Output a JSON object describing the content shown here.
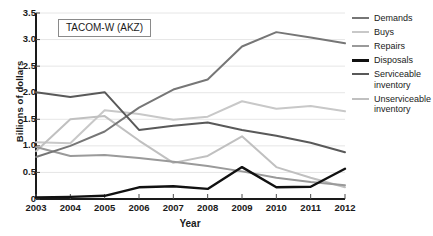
{
  "chart_data": {
    "type": "line",
    "title": "TACOM-W (AKZ)",
    "xlabel": "Year",
    "ylabel": "Billions of dollars",
    "x": [
      2003,
      2004,
      2005,
      2006,
      2007,
      2008,
      2009,
      2010,
      2011,
      2012
    ],
    "xticklabels": [
      "2003",
      "2004",
      "2005",
      "2006",
      "2007",
      "2008",
      "2009",
      "2010",
      "2011",
      "2012"
    ],
    "yticklabels": [
      "0",
      "0.5",
      "1.0",
      "1.5",
      "2.0",
      "2.5",
      "3.0",
      "3.5"
    ],
    "ytickvalues": [
      0,
      0.5,
      1.0,
      1.5,
      2.0,
      2.5,
      3.0,
      3.5
    ],
    "ylim": [
      0,
      3.5
    ],
    "xlim": [
      2003,
      2012
    ],
    "grid": true,
    "legend_position": "right",
    "series": [
      {
        "name": "Demands",
        "color": "#767676",
        "width": 2.0,
        "values": [
          0.79,
          1.0,
          1.27,
          1.72,
          2.06,
          2.25,
          2.87,
          3.14,
          3.04,
          2.93
        ]
      },
      {
        "name": "Buys",
        "color": "#c8c8c8",
        "width": 2.0,
        "values": [
          1.07,
          1.05,
          1.67,
          1.6,
          1.49,
          1.55,
          1.84,
          1.7,
          1.75,
          1.65
        ]
      },
      {
        "name": "Repairs",
        "color": "#9a9a9a",
        "width": 2.0,
        "values": [
          0.98,
          0.81,
          0.83,
          0.77,
          0.7,
          0.62,
          0.52,
          0.4,
          0.32,
          0.26
        ]
      },
      {
        "name": "Disposals",
        "color": "#111111",
        "width": 2.4,
        "values": [
          0.03,
          0.04,
          0.06,
          0.22,
          0.24,
          0.19,
          0.6,
          0.22,
          0.23,
          0.57
        ]
      },
      {
        "name": "Serviceable inventory",
        "color": "#595959",
        "width": 2.0,
        "values": [
          2.01,
          1.92,
          2.01,
          1.3,
          1.38,
          1.44,
          1.3,
          1.19,
          1.06,
          0.88
        ]
      },
      {
        "name": "Unserviceable inventory",
        "color": "#c0c0c0",
        "width": 2.0,
        "values": [
          0.9,
          1.5,
          1.56,
          1.1,
          0.68,
          0.81,
          1.18,
          0.6,
          0.4,
          0.22
        ]
      }
    ]
  },
  "legend": {
    "items": [
      {
        "label": "Demands"
      },
      {
        "label": "Buys"
      },
      {
        "label": "Repairs"
      },
      {
        "label": "Disposals"
      },
      {
        "label": "Serviceable inventory"
      },
      {
        "label": "Unserviceable inventory"
      }
    ]
  }
}
